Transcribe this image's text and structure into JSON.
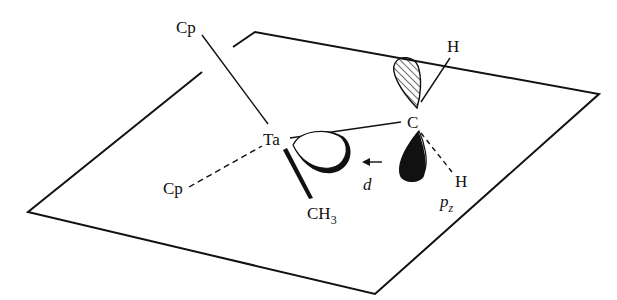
{
  "diagram": {
    "type": "molecular orbital diagram",
    "labels": {
      "cp_top": "Cp",
      "cp_bottom": "Cp",
      "ta": "Ta",
      "c": "C",
      "h_top": "H",
      "h_bottom": "H",
      "ch3_main": "CH",
      "ch3_sub": "3",
      "d_orbital": "d",
      "pz_main": "p",
      "pz_sub": "z"
    },
    "plane": {
      "corners": [
        [
          255,
          32
        ],
        [
          599,
          94
        ],
        [
          375,
          294
        ],
        [
          28,
          212
        ]
      ]
    },
    "colors": {
      "line": "#111111",
      "background": "#ffffff"
    }
  }
}
